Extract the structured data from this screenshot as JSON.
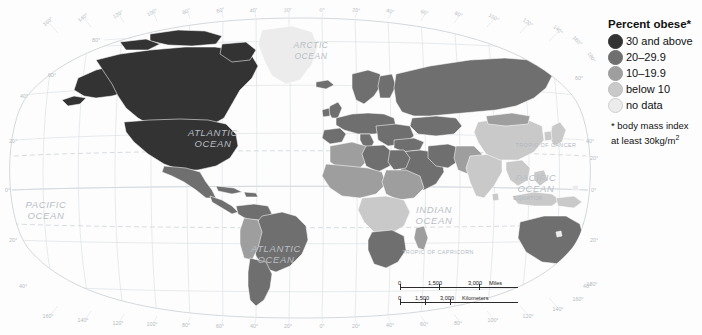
{
  "map": {
    "title": "World map of obesity prevalence",
    "projection": "robinson",
    "ocean_labels": [
      {
        "text": "ARCTIC",
        "x": 311,
        "y": 48
      },
      {
        "text": "OCEAN",
        "x": 311,
        "y": 59
      },
      {
        "text": "ATLANTIC",
        "x": 213,
        "y": 136
      },
      {
        "text": "OCEAN",
        "x": 213,
        "y": 147
      },
      {
        "text": "PACIFIC",
        "x": 36,
        "y": 208
      },
      {
        "text": "OCEAN",
        "x": 36,
        "y": 219
      },
      {
        "text": "ATLANTIC",
        "x": 276,
        "y": 252
      },
      {
        "text": "OCEAN",
        "x": 276,
        "y": 263
      },
      {
        "text": "INDIAN",
        "x": 430,
        "y": 213
      },
      {
        "text": "OCEAN",
        "x": 430,
        "y": 224
      },
      {
        "text": "PACIFIC",
        "x": 531,
        "y": 181
      },
      {
        "text": "OCEAN",
        "x": 531,
        "y": 192
      }
    ],
    "reference_lines": [
      {
        "label": "TROPIC OF CANCER",
        "x": 546,
        "y": 147
      },
      {
        "label": "EQUATOR",
        "x": 528,
        "y": 200
      },
      {
        "label": "TROPIC OF CAPRICORN",
        "x": 438,
        "y": 254
      }
    ],
    "longitude_labels_top": [
      "160°",
      "140°",
      "120°",
      "100°",
      "80°",
      "60°",
      "40°",
      "20°",
      "0°",
      "20°",
      "40°",
      "60°",
      "80°",
      "100°",
      "120°",
      "140°",
      "160°",
      "180°"
    ],
    "longitude_labels_bottom": [
      "160°",
      "140°",
      "120°",
      "100°",
      "80°",
      "60°",
      "40°",
      "20°",
      "0°",
      "20°",
      "40°",
      "60°",
      "80°",
      "100°",
      "120°",
      "140°",
      "160°",
      "180°"
    ],
    "latitude_labels_left": [
      "80°",
      "60°",
      "40°",
      "20°",
      "0°",
      "20°",
      "40°"
    ],
    "latitude_labels_right": [
      "60°",
      "40°",
      "20°",
      "0°",
      "20°",
      "40°"
    ]
  },
  "legend": {
    "title": "Percent obese*",
    "items": [
      {
        "label": "30 and above",
        "color": "#333333"
      },
      {
        "label": "20–29.9",
        "color": "#6f6f6f"
      },
      {
        "label": "10–19.9",
        "color": "#9e9e9e"
      },
      {
        "label": "below 10",
        "color": "#c9c9c9"
      },
      {
        "label": "no data",
        "color": "#ececec"
      }
    ],
    "note_line1": "* body mass index",
    "note_line2": "at least 30kg/m",
    "note_sup": "2"
  },
  "scalebar": {
    "miles": {
      "zero": "0",
      "mid": "1,500",
      "end": "3,000",
      "units": "Miles"
    },
    "kilometers": {
      "zero": "0",
      "mid": "1,500",
      "end": "3,000",
      "units": "Kilometers"
    }
  },
  "colors": {
    "ocean": "#fdfdfd",
    "graticule": "#d9dde1",
    "frame": "#c3c8cd",
    "country_border": "#ffffff",
    "cat_30plus": "#333333",
    "cat_20_29": "#6f6f6f",
    "cat_10_19": "#9e9e9e",
    "cat_below10": "#c9c9c9",
    "cat_nodata": "#ececec"
  }
}
